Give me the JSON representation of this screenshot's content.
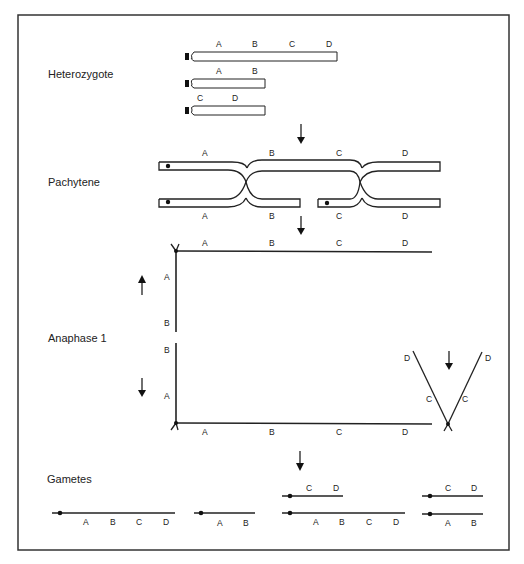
{
  "figure": {
    "stages": {
      "heterozygote": "Heterozygote",
      "pachytene": "Pachytene",
      "anaphase": "Anaphase 1",
      "gametes": "Gametes"
    },
    "genes": {
      "a": "A",
      "b": "B",
      "c": "C",
      "d": "D"
    }
  }
}
